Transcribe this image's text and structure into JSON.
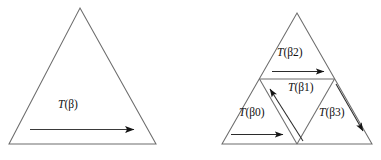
{
  "figure": {
    "kind": "geometric-diagram",
    "stroke_color": "#6b6b6b",
    "arrow_color": "#1a1a1a",
    "background": "#ffffff"
  },
  "left_panel": {
    "name": "whole-triangle",
    "label": "T(β)",
    "label_fn": "T",
    "label_arg": "(β)",
    "arrow": {
      "name": "traversal-arrow",
      "direction": "left-to-right",
      "from_x": 30,
      "from_y": 129,
      "to_x": 141,
      "to_y": 129
    },
    "triangle": {
      "apex_x": 80,
      "apex_y": 8,
      "left_x": 9,
      "left_y": 144,
      "right_x": 156,
      "right_y": 144
    }
  },
  "right_panel": {
    "name": "subdivided-triangle",
    "triangle": {
      "apex_x": 297,
      "apex_y": 13,
      "left_x": 222,
      "left_y": 144,
      "right_x": 372,
      "right_y": 144
    },
    "sub_triangles": [
      {
        "name": "sub-triangle-beta0",
        "label": "T(β0)",
        "label_fn": "T",
        "label_arg": "(β0)",
        "label_x": 239,
        "label_y": 113,
        "arrow": {
          "direction": "right",
          "from_x": 231,
          "from_y": 134,
          "to_x": 290,
          "to_y": 134
        }
      },
      {
        "name": "sub-triangle-beta1",
        "label": "T(β1)",
        "label_fn": "T",
        "label_arg": "(β1)",
        "label_x": 291,
        "label_y": 88,
        "arrow": {
          "direction": "up-left",
          "from_x": 302,
          "from_y": 140,
          "to_x": 266,
          "to_y": 84
        }
      },
      {
        "name": "sub-triangle-beta2",
        "label": "T(β2)",
        "label_fn": "T",
        "label_arg": "(β2)",
        "label_x": 278,
        "label_y": 53,
        "arrow": {
          "direction": "right",
          "from_x": 272,
          "from_y": 71,
          "to_x": 331,
          "to_y": 71
        }
      },
      {
        "name": "sub-triangle-beta3",
        "label": "T(β3)",
        "label_fn": "T",
        "label_arg": "(β3)",
        "label_x": 320,
        "label_y": 113,
        "arrow": {
          "direction": "down-right",
          "from_x": 336,
          "from_y": 84,
          "to_x": 368,
          "to_y": 138
        }
      }
    ]
  },
  "caption": {
    "text": ""
  }
}
